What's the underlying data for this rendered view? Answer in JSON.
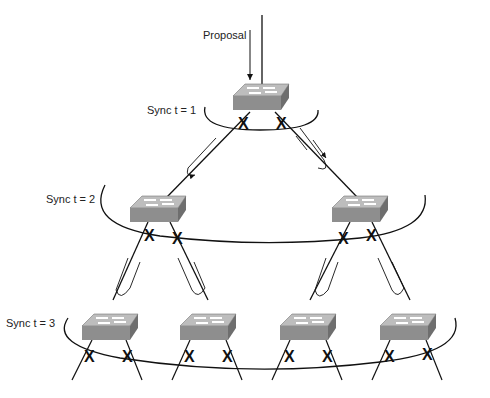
{
  "diagram": {
    "labels": {
      "proposal": "Proposal",
      "sync1": "Sync t = 1",
      "sync2": "Sync t = 2",
      "sync3": "Sync t = 3"
    },
    "colors": {
      "switch_top": "#b8b8b8",
      "switch_front": "#8c8c8c",
      "switch_side": "#6e6e6e",
      "line": "#111111"
    },
    "levels": [
      {
        "name": "root",
        "switches": 1,
        "sync": "t = 1"
      },
      {
        "name": "level-2",
        "switches": 2,
        "sync": "t = 2"
      },
      {
        "name": "level-3",
        "switches": 4,
        "sync": "t = 3"
      }
    ]
  }
}
